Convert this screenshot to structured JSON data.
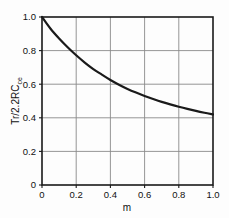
{
  "chart_data": {
    "type": "line",
    "title": "",
    "subtitle": "",
    "xlabel": "m",
    "ylabel": "Tr/2.2RC",
    "ylabel_subscript": "ce",
    "ylabel_full": "Tr/2.2RCce",
    "xlim": [
      0,
      1.0
    ],
    "ylim": [
      0,
      1.0
    ],
    "grid": true,
    "legend": null,
    "legend_position": "none",
    "xticks": [
      0,
      0.2,
      0.4,
      0.6,
      0.8,
      1.0
    ],
    "yticks": [
      0,
      0.2,
      0.4,
      0.6,
      0.8,
      1.0
    ],
    "xtick_labels": [
      "0",
      "0.2",
      "0.4",
      "0.6",
      "0.8",
      "1.0"
    ],
    "ytick_labels": [
      "0",
      "0.2",
      "0.4",
      "0.6",
      "0.8",
      "1.0"
    ],
    "series": [
      {
        "name": "Tr/2.2RCce vs m",
        "color": "#1a1a1a",
        "line_width": 2.2,
        "x": [
          0.0,
          0.05,
          0.1,
          0.15,
          0.2,
          0.25,
          0.3,
          0.35,
          0.4,
          0.45,
          0.5,
          0.55,
          0.6,
          0.65,
          0.7,
          0.75,
          0.8,
          0.85,
          0.9,
          0.95,
          1.0
        ],
        "values": [
          1.0,
          0.93,
          0.872,
          0.82,
          0.772,
          0.729,
          0.69,
          0.657,
          0.625,
          0.597,
          0.572,
          0.55,
          0.53,
          0.512,
          0.495,
          0.48,
          0.466,
          0.453,
          0.441,
          0.43,
          0.42
        ]
      }
    ],
    "annotations": []
  },
  "colors": {
    "curve": "#1a1a1a",
    "frame": "#1a1a1a",
    "grid": "#8a8a8a",
    "text": "#111111",
    "background": "#fdfdfd"
  }
}
